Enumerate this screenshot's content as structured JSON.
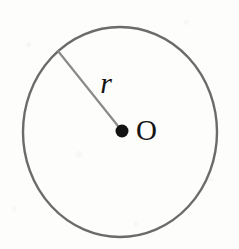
{
  "figure": {
    "name": "circle-with-radius",
    "background_color": "#fdfdfc",
    "width": 239,
    "height": 249
  },
  "circle": {
    "name": "circle-outline",
    "center_x": 120,
    "center_y": 132,
    "radius_x": 97,
    "radius_y": 105,
    "stroke_color": "#6b6b6b",
    "stroke_width": 2.4,
    "fill": "none"
  },
  "center_point": {
    "name": "center-dot",
    "x": 122,
    "y": 131,
    "radius": 6.5,
    "color": "#131313"
  },
  "radius_segment": {
    "name": "radius-line",
    "x1": 122,
    "y1": 131,
    "x2": 58,
    "y2": 51,
    "stroke_color": "#8a8a8a",
    "stroke_width": 2.2
  },
  "labels": {
    "radius": {
      "text": "r",
      "x": 106,
      "y": 93,
      "font_size": 30,
      "color": "#141414"
    },
    "center": {
      "text": "O",
      "x": 136,
      "y": 140,
      "font_size": 29,
      "color": "#141414"
    }
  }
}
